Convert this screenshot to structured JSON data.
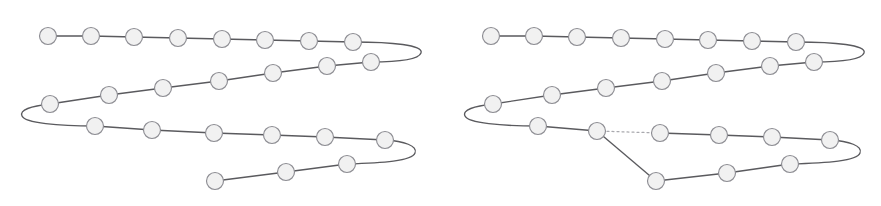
{
  "figure": {
    "background_color": "#ffffff",
    "width": 881,
    "height": 206,
    "bead_fill_color": "#f1f1f1",
    "bead_stroke_color": "#8d8d93",
    "bond_color": "#5a5a5e",
    "broken_bond_color": "#a9a9ae",
    "bead_radius": 8.5,
    "panels": [
      {
        "name": "left-panel",
        "label": "",
        "bead_count": 25,
        "broken_bond_count": 0,
        "beads": [
          {
            "id": 1,
            "x": 48,
            "y": 36
          },
          {
            "id": 2,
            "x": 91,
            "y": 36
          },
          {
            "id": 3,
            "x": 134,
            "y": 37
          },
          {
            "id": 4,
            "x": 178,
            "y": 38
          },
          {
            "id": 5,
            "x": 222,
            "y": 39
          },
          {
            "id": 6,
            "x": 265,
            "y": 40
          },
          {
            "id": 7,
            "x": 309,
            "y": 41
          },
          {
            "id": 8,
            "x": 353,
            "y": 42
          },
          {
            "id": 9,
            "x": 371,
            "y": 62
          },
          {
            "id": 10,
            "x": 327,
            "y": 66
          },
          {
            "id": 11,
            "x": 273,
            "y": 73
          },
          {
            "id": 12,
            "x": 219,
            "y": 81
          },
          {
            "id": 13,
            "x": 163,
            "y": 88
          },
          {
            "id": 14,
            "x": 109,
            "y": 95
          },
          {
            "id": 15,
            "x": 50,
            "y": 104
          },
          {
            "id": 16,
            "x": 95,
            "y": 126
          },
          {
            "id": 17,
            "x": 152,
            "y": 130
          },
          {
            "id": 18,
            "x": 214,
            "y": 133
          },
          {
            "id": 19,
            "x": 272,
            "y": 135
          },
          {
            "id": 20,
            "x": 325,
            "y": 137
          },
          {
            "id": 21,
            "x": 385,
            "y": 140
          },
          {
            "id": 22,
            "x": 347,
            "y": 164
          },
          {
            "id": 23,
            "x": 286,
            "y": 172
          },
          {
            "id": 24,
            "x": 215,
            "y": 181
          }
        ],
        "turns": [
          {
            "from_bead": 8,
            "to_bead": 9,
            "side": "right",
            "apex_x": 421,
            "apex_y": 52
          },
          {
            "from_bead": 15,
            "to_bead": 16,
            "side": "left",
            "apex_x": 23,
            "apex_y": 116
          },
          {
            "from_bead": 21,
            "to_bead": 22,
            "side": "right",
            "apex_x": 412,
            "apex_y": 153
          }
        ]
      },
      {
        "name": "right-panel",
        "label": "",
        "bead_count": 25,
        "broken_bond_count": 1,
        "beads": [
          {
            "id": 1,
            "x": 491,
            "y": 36
          },
          {
            "id": 2,
            "x": 534,
            "y": 36
          },
          {
            "id": 3,
            "x": 577,
            "y": 37
          },
          {
            "id": 4,
            "x": 621,
            "y": 38
          },
          {
            "id": 5,
            "x": 665,
            "y": 39
          },
          {
            "id": 6,
            "x": 708,
            "y": 40
          },
          {
            "id": 7,
            "x": 752,
            "y": 41
          },
          {
            "id": 8,
            "x": 796,
            "y": 42
          },
          {
            "id": 9,
            "x": 814,
            "y": 62
          },
          {
            "id": 10,
            "x": 770,
            "y": 66
          },
          {
            "id": 11,
            "x": 716,
            "y": 73
          },
          {
            "id": 12,
            "x": 662,
            "y": 81
          },
          {
            "id": 13,
            "x": 606,
            "y": 88
          },
          {
            "id": 14,
            "x": 552,
            "y": 95
          },
          {
            "id": 15,
            "x": 493,
            "y": 104
          },
          {
            "id": 16,
            "x": 538,
            "y": 126
          },
          {
            "id": 17,
            "x": 597,
            "y": 131
          },
          {
            "id": 18,
            "x": 660,
            "y": 133
          },
          {
            "id": 19,
            "x": 719,
            "y": 135
          },
          {
            "id": 20,
            "x": 772,
            "y": 137
          },
          {
            "id": 21,
            "x": 830,
            "y": 140
          },
          {
            "id": 22,
            "x": 656,
            "y": 181
          },
          {
            "id": 23,
            "x": 727,
            "y": 173
          },
          {
            "id": 24,
            "x": 790,
            "y": 164
          }
        ],
        "turns": [
          {
            "from_bead": 8,
            "to_bead": 9,
            "side": "right",
            "apex_x": 864,
            "apex_y": 52
          },
          {
            "from_bead": 15,
            "to_bead": 16,
            "side": "left",
            "apex_x": 466,
            "apex_y": 116
          },
          {
            "from_bead": 21,
            "to_bead": 24,
            "side": "right",
            "apex_x": 857,
            "apex_y": 153
          }
        ],
        "broken_bonds": [
          {
            "from_bead": 17,
            "to_bead": 18,
            "style": "dotted"
          }
        ],
        "added_bonds": [
          {
            "from_bead": 17,
            "to_bead": 22,
            "style": "solid"
          }
        ]
      }
    ]
  }
}
